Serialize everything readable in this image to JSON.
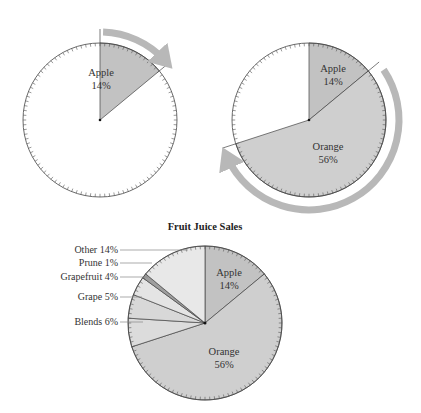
{
  "colors": {
    "apple": "#c2c2c2",
    "orange": "#cfcfcf",
    "blends": "#dcdcdc",
    "grape": "#d8d8d8",
    "grapefruit": "#e4e4e4",
    "prune": "#9e9e9e",
    "other": "#e8e8e8",
    "empty": "#ffffff",
    "outline": "#444444",
    "arrow": "#b8b8b8",
    "leader": "#888888"
  },
  "panels": [
    {
      "id": "step-1",
      "cx": 100,
      "cy": 120,
      "r": 77,
      "slices": [
        {
          "name": "Apple",
          "label": "Apple",
          "pct_label": "14%",
          "start": 0,
          "end": 50.4,
          "color_key": "apple",
          "label_x": 101,
          "label_y": 76
        }
      ],
      "arrow": {
        "start": 2,
        "end": 52,
        "r": 88,
        "direction": "clockwise"
      }
    },
    {
      "id": "step-2",
      "cx": 309,
      "cy": 120,
      "r": 77,
      "slices": [
        {
          "name": "Apple",
          "label": "Apple",
          "pct_label": "14%",
          "start": 0,
          "end": 50.4,
          "color_key": "apple",
          "label_x": 333,
          "label_y": 72
        },
        {
          "name": "Orange",
          "label": "Orange",
          "pct_label": "56%",
          "start": 50.4,
          "end": 252,
          "color_key": "orange",
          "label_x": 328,
          "label_y": 150
        }
      ],
      "arrow": {
        "start": 56,
        "end": 250,
        "r": 90,
        "direction": "clockwise"
      }
    }
  ],
  "chart_data": {
    "type": "pie",
    "title": "Fruit Juice Sales",
    "categories": [
      "Apple",
      "Orange",
      "Blends",
      "Grape",
      "Grapefruit",
      "Prune",
      "Other"
    ],
    "values": [
      14,
      56,
      6,
      5,
      4,
      1,
      14
    ],
    "labels": [
      "Apple 14%",
      "Orange 56%",
      "Blends 6%",
      "Grape 5%",
      "Grapefruit 4%",
      "Prune 1%",
      "Other 14%"
    ],
    "start_angle": "12 o'clock, clockwise",
    "cx": 205,
    "cy": 323,
    "r": 77
  },
  "final_chart": {
    "title": "Fruit Juice Sales",
    "slices": [
      {
        "name": "Apple",
        "pct": 14,
        "color_key": "apple",
        "inside": true,
        "label": "Apple",
        "pct_label": "14%",
        "label_x": 229,
        "label_y": 276
      },
      {
        "name": "Orange",
        "pct": 56,
        "color_key": "orange",
        "inside": true,
        "label": "Orange",
        "pct_label": "56%",
        "label_x": 224,
        "label_y": 355
      },
      {
        "name": "Blends",
        "pct": 6,
        "color_key": "blends",
        "inside": false,
        "side_label": "Blends 6%",
        "lx": 118,
        "ly": 325,
        "ex": 143,
        "ey": 325
      },
      {
        "name": "Grape",
        "pct": 5,
        "color_key": "grape",
        "inside": false,
        "side_label": "Grape 5%",
        "lx": 118,
        "ly": 300,
        "ex": 142,
        "ey": 300
      },
      {
        "name": "Grapefruit",
        "pct": 4,
        "color_key": "grapefruit",
        "inside": false,
        "side_label": "Grapefruit 4%",
        "lx": 118,
        "ly": 280,
        "ex": 148,
        "ey": 280
      },
      {
        "name": "Prune",
        "pct": 1,
        "color_key": "prune",
        "inside": false,
        "side_label": "Prune 1%",
        "lx": 118,
        "ly": 266,
        "ex": 152,
        "ey": 266
      },
      {
        "name": "Other",
        "pct": 14,
        "color_key": "other",
        "inside": false,
        "side_label": "Other 14%",
        "lx": 118,
        "ly": 253,
        "ex": 188,
        "ey": 253
      }
    ]
  }
}
